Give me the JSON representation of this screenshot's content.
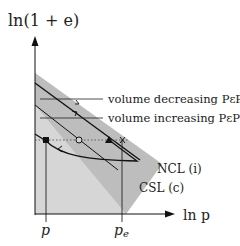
{
  "diagram": {
    "y_axis_label": "ln(1 + e)",
    "x_axis_label": "ln p",
    "x_ticks": [
      {
        "label": "p",
        "x": 47
      },
      {
        "label": "p",
        "subscript": "e",
        "x": 126
      }
    ],
    "annotations": [
      {
        "id": "volume-decreasing",
        "text": "volume decreasing PεPs"
      },
      {
        "id": "volume-increasing",
        "text": "volume increasing PεPs"
      }
    ],
    "lines": [
      {
        "id": "ncl",
        "label": "NCL (i)"
      },
      {
        "id": "csl",
        "label": "CSL (c)"
      }
    ],
    "markers": [
      {
        "shape": "filled-square",
        "x": 46,
        "y": 140
      },
      {
        "shape": "open-circle",
        "x": 79,
        "y": 140
      },
      {
        "shape": "filled-triangle",
        "x": 109,
        "y": 140
      },
      {
        "shape": "cross",
        "x": 123,
        "y": 140
      }
    ],
    "colors": {
      "outer_region": "#d4d4d4",
      "band_region": "#b8b8b8",
      "lines": "#111111",
      "dotted": "#555555"
    }
  }
}
